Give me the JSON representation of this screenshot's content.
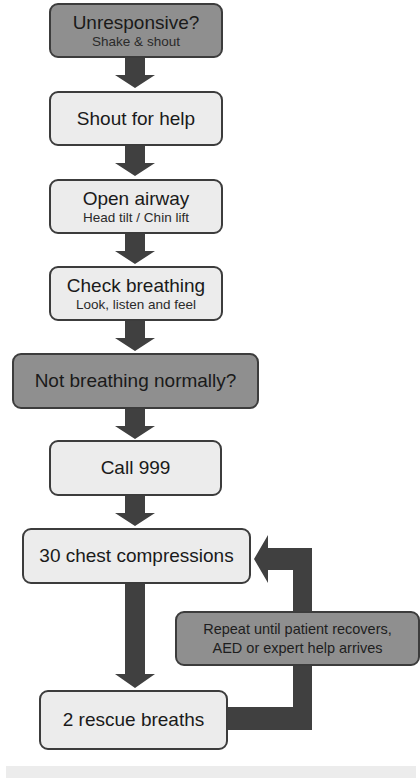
{
  "flowchart": {
    "steps": [
      {
        "title": "Unresponsive?",
        "subtitle": "Shake & shout",
        "style": "dark"
      },
      {
        "title": "Shout for help",
        "style": "light"
      },
      {
        "title": "Open airway",
        "subtitle": "Head tilt / Chin lift",
        "style": "light"
      },
      {
        "title": "Check breathing",
        "subtitle": "Look, listen and feel",
        "style": "light"
      },
      {
        "title": "Not breathing normally?",
        "style": "dark"
      },
      {
        "title": "Call 999",
        "style": "light"
      },
      {
        "title": "30 chest compressions",
        "style": "light"
      },
      {
        "title": "2 rescue breaths",
        "style": "light"
      }
    ],
    "loop_note": {
      "line1": "Repeat until patient recovers,",
      "line2": "AED or expert help arrives"
    }
  },
  "colors": {
    "dark_box": "#8f8f8f",
    "light_box": "#ececec",
    "arrow": "#404040",
    "border": "#3c3c3c"
  }
}
